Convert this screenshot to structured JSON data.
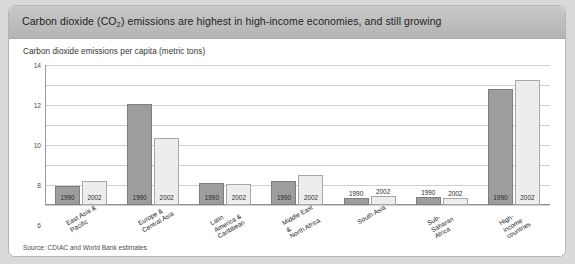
{
  "header": {
    "title_before": "Carbon dioxide (CO",
    "title_sub": "2",
    "title_after": ") emissions are highest in high-income economies, and still growing"
  },
  "subtitle": "Carbon dioxide emissions per capita (metric tons)",
  "source": "Source: CDIAC and World Bank estimates",
  "colors": {
    "series_1990": "#9d9d9d",
    "series_2002": "#ededed",
    "header_bg": "#bdbdbd",
    "gridline": "#cfcfcf",
    "card_bg": "#ffffff",
    "page_bg": "#d9d9d9"
  },
  "chart_data": {
    "type": "bar",
    "title": "Carbon dioxide (CO2) emissions are highest in high-income economies, and still growing",
    "subtitle": "Carbon dioxide emissions per capita (metric tons)",
    "xlabel": "",
    "ylabel": "Carbon dioxide emissions per capita (metric tons)",
    "ylim": [
      0,
      14
    ],
    "yticks": [
      0,
      2,
      4,
      6,
      8,
      10,
      12,
      14
    ],
    "grid": true,
    "legend": "in-bar labels",
    "categories": [
      "East Asia & Pacific",
      "Europe & Central Asia",
      "Latin America &\nCaribbean",
      "Middle East &\nNorth Africa",
      "South Asia",
      "Sub-Saharan Africa",
      "High-income countries"
    ],
    "series": [
      {
        "name": "1990",
        "values": [
          1.9,
          10.1,
          2.2,
          2.4,
          0.7,
          0.8,
          11.6
        ]
      },
      {
        "name": "2002",
        "values": [
          2.4,
          6.7,
          2.1,
          3.0,
          0.9,
          0.7,
          12.5
        ]
      }
    ]
  }
}
